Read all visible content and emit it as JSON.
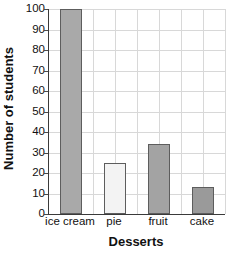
{
  "chart_data": {
    "type": "bar",
    "title": "",
    "xlabel": "Desserts",
    "ylabel": "Number of students",
    "categories": [
      "ice cream",
      "pie",
      "fruit",
      "cake"
    ],
    "values": [
      100,
      25,
      34,
      13
    ],
    "series": [
      {
        "name": "Number of students",
        "values": [
          100,
          25,
          34,
          13
        ]
      }
    ],
    "ylim": [
      0,
      100
    ],
    "y_ticks": [
      0,
      10,
      20,
      30,
      40,
      50,
      60,
      70,
      80,
      90,
      100
    ],
    "y_tick_labels": [
      "0",
      "10",
      "20",
      "30",
      "40",
      "50",
      "60",
      "70",
      "80",
      "90",
      "100"
    ],
    "grid": true,
    "grid_vertical_cells": 8,
    "legend": "none",
    "legend_position": "none",
    "bar_colors": [
      "#a9a9a9",
      "#f3f3f3",
      "#a3a3a3",
      "#9a9a9a"
    ],
    "bar_edge_color": "#5d5d5d",
    "grid_color": "#d8d8d8",
    "axis_color": "#3a3a3a",
    "background_color": "#ffffff",
    "text_color": "#111111"
  },
  "axes": {
    "y_title": "Number of students",
    "x_title": "Desserts"
  }
}
